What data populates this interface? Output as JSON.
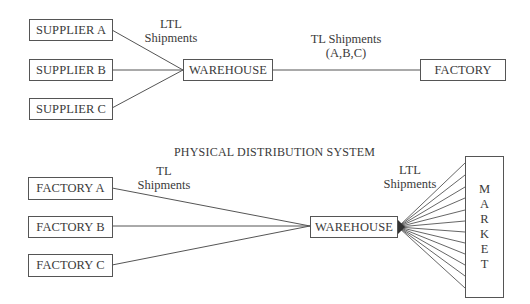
{
  "inbound": {
    "suppliers": [
      {
        "label": "SUPPLIER A"
      },
      {
        "label": "SUPPLIER B"
      },
      {
        "label": "SUPPLIER C"
      }
    ],
    "warehouse": {
      "label": "WAREHOUSE"
    },
    "factory": {
      "label": "FACTORY"
    },
    "ltl_label": {
      "line1": "LTL",
      "line2": "Shipments"
    },
    "tl_label": {
      "line1": "TL Shipments",
      "line2": "(A,B,C)"
    }
  },
  "physical_distribution": {
    "title": "PHYSICAL DISTRIBUTION SYSTEM",
    "factories": [
      {
        "label": "FACTORY A"
      },
      {
        "label": "FACTORY B"
      },
      {
        "label": "FACTORY C"
      }
    ],
    "warehouse": {
      "label": "WAREHOUSE"
    },
    "market": {
      "letters": [
        "M",
        "A",
        "R",
        "K",
        "E",
        "T"
      ]
    },
    "tl_label": {
      "line1": "TL",
      "line2": "Shipments"
    },
    "ltl_label": {
      "line1": "LTL",
      "line2": "Shipments"
    },
    "market_line_count": 12
  },
  "colors": {
    "line": "#555555",
    "text": "#3a3a3a",
    "background": "#ffffff"
  }
}
